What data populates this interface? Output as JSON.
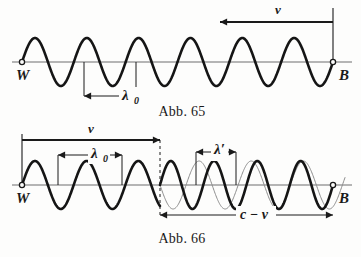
{
  "meta": {
    "background": "#fdfdfc",
    "ink": "#1a1a1a",
    "thin_ink": "#8c8c8c",
    "axis_ink": "#6e6e6e"
  },
  "figures": [
    {
      "id": "abb-65",
      "caption": "Abb. 65",
      "caption_x": 182,
      "caption_y": 116,
      "baseline_y": 62,
      "axis_x1": 12,
      "axis_x2": 352,
      "endpoints": {
        "left_label": "W",
        "left_label_x": 16,
        "left_label_y": 80,
        "left_dot_x": 22,
        "right_label": "B",
        "right_label_x": 339,
        "right_label_y": 80,
        "right_dot_x": 333
      },
      "wave": {
        "x_start": 22,
        "x_end": 333,
        "cycles": 6,
        "amplitude": 24,
        "stroke_width": 2.6,
        "color": "#151515",
        "phase": 0
      },
      "velocity_arrow": {
        "label": "v",
        "label_x": 275,
        "label_y": 14,
        "y": 22,
        "x_from": 333,
        "x_to": 220,
        "direction": "left",
        "tick_x": 333,
        "tick_y1": 8,
        "tick_y2": 62
      },
      "dimensions": [
        {
          "name": "lambda0",
          "label": "λ",
          "sub": "0",
          "label_x": 122,
          "label_y": 100,
          "sub_x": 134,
          "sub_y": 104,
          "y": 96,
          "x1": 84,
          "x2": 136,
          "ext_y_top": 62,
          "ext_lines": true
        }
      ]
    },
    {
      "id": "abb-66",
      "caption": "Abb. 66",
      "caption_x": 182,
      "caption_y": 243,
      "baseline_y": 185,
      "axis_x1": 12,
      "axis_x2": 352,
      "endpoints": {
        "left_label": "W",
        "left_label_x": 16,
        "left_label_y": 203,
        "left_dot_x": 22,
        "right_label": "B",
        "right_label_x": 339,
        "right_label_y": 203,
        "right_dot_x": 333
      },
      "wave_thick": {
        "x_start": 22,
        "x_end": 333,
        "segments": [
          {
            "x_from": 22,
            "x_to": 160,
            "cycles": 2.67,
            "amplitude": 24
          },
          {
            "x_from": 160,
            "x_to": 333,
            "cycles": 4.0,
            "amplitude": 24
          }
        ],
        "stroke_width": 2.6,
        "color": "#151515"
      },
      "wave_thin": {
        "x_from": 160,
        "x_to": 345,
        "cycles": 3.55,
        "amplitude": 24,
        "stroke_width": 1.0,
        "color": "#8c8c8c"
      },
      "velocity_arrow": {
        "label": "v",
        "label_x": 88,
        "label_y": 133,
        "y": 140,
        "x_from": 22,
        "x_to": 160,
        "direction": "right",
        "tick_x": 22,
        "tick_y1": 134,
        "tick_y2": 185
      },
      "dashed_divider": {
        "x": 160,
        "y1": 140,
        "y2": 215,
        "dash": "3,3"
      },
      "dimensions": [
        {
          "name": "lambda0",
          "label": "λ",
          "sub": "0",
          "label_x": 91,
          "label_y": 158,
          "sub_x": 103,
          "sub_y": 162,
          "y": 155,
          "x1": 58,
          "x2": 122,
          "ext_y_bot": 185,
          "ext_lines": true
        },
        {
          "name": "lambda-prime",
          "label": "λ′",
          "sub": "",
          "label_x": 214,
          "label_y": 154,
          "sub_x": 0,
          "sub_y": 0,
          "y": 152,
          "x1": 196,
          "x2": 236,
          "ext_y_bot": 185,
          "ext_lines": true
        },
        {
          "name": "c-minus-v",
          "label": "c − v",
          "sub": "",
          "label_x": 240,
          "label_y": 219,
          "sub_x": 0,
          "sub_y": 0,
          "y": 215,
          "x1": 160,
          "x2": 333,
          "ext_y_bot": 0,
          "ext_lines": false
        }
      ]
    }
  ]
}
